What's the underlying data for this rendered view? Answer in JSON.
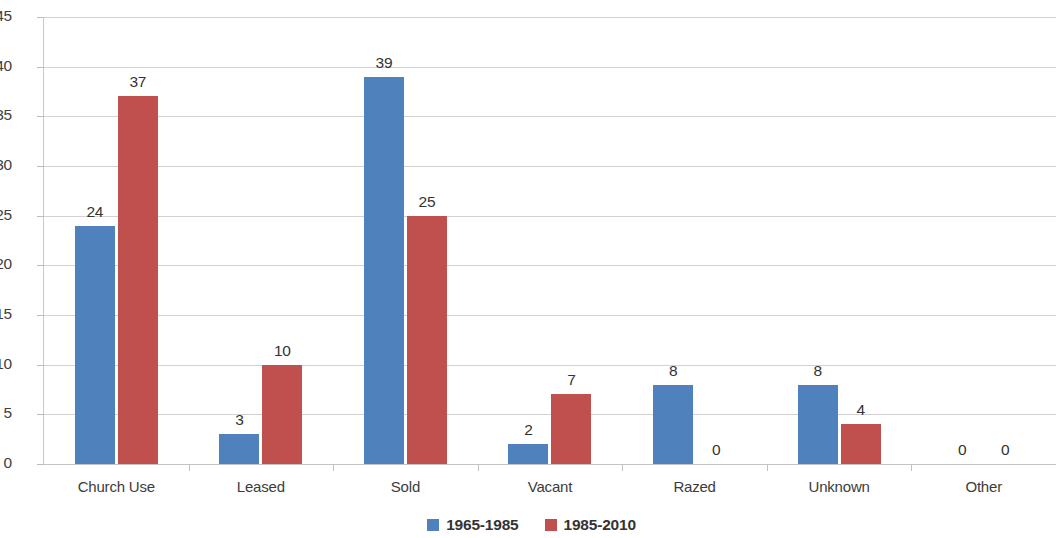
{
  "chart_data": {
    "type": "bar",
    "title": "",
    "subtitle": "",
    "xlabel": "",
    "ylabel": "",
    "ylim": [
      0,
      45
    ],
    "ytick_step": 5,
    "yticks": [
      "45",
      "40",
      "35",
      "30",
      "25",
      "20",
      "15",
      "10",
      "5",
      "0"
    ],
    "grid": true,
    "legend_position": "bottom",
    "categories": [
      "Church Use",
      "Leased",
      "Sold",
      "Vacant",
      "Razed",
      "Unknown",
      "Other"
    ],
    "series": [
      {
        "name": "1965-1985",
        "color": "#4F81BD",
        "values": [
          24,
          3,
          39,
          2,
          8,
          8,
          0
        ],
        "labels": [
          "24",
          "3",
          "39",
          "2",
          "8",
          "8",
          "0"
        ]
      },
      {
        "name": "1985-2010",
        "color": "#C0504D",
        "values": [
          37,
          10,
          25,
          7,
          0,
          4,
          0
        ],
        "labels": [
          "37",
          "10",
          "25",
          "7",
          "0",
          "4",
          "0"
        ]
      }
    ]
  },
  "colors": {
    "series_1965_1985": "#4F81BD",
    "series_1985_2010": "#C0504D",
    "gridline": "#D2D2D2",
    "axis": "#C9C9C9",
    "text": "#3A3A3A",
    "background": "#FFFFFF"
  }
}
